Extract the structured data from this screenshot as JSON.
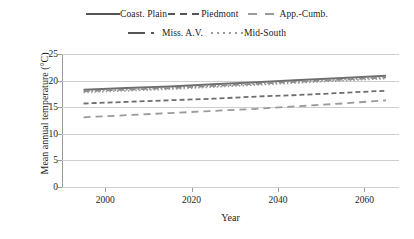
{
  "chart_data": {
    "type": "line",
    "title": "",
    "xlabel": "Year",
    "ylabel": "Mean annual temperature (°C)",
    "xlim": [
      1990,
      2068
    ],
    "ylim": [
      0,
      25
    ],
    "xticks": [
      2000,
      2020,
      2040,
      2060
    ],
    "yticks": [
      0,
      5,
      10,
      15,
      20,
      25
    ],
    "grid": true,
    "legend_position": "top-center",
    "x": [
      1995,
      2005,
      2015,
      2025,
      2035,
      2045,
      2055,
      2065
    ],
    "series": [
      {
        "name": "Coast. Plain",
        "style": "solid",
        "color": "#6e6e6e",
        "values": [
          18.3,
          18.6,
          18.9,
          19.3,
          19.7,
          20.1,
          20.5,
          20.9
        ]
      },
      {
        "name": "Piedmont",
        "style": "dashed",
        "color": "#6e6e6e",
        "values": [
          15.7,
          16.0,
          16.3,
          16.6,
          17.0,
          17.3,
          17.7,
          18.1
        ]
      },
      {
        "name": "App.-Cumb.",
        "style": "long-dash",
        "color": "#9a9a9a",
        "values": [
          13.1,
          13.5,
          13.9,
          14.3,
          14.7,
          15.2,
          15.7,
          16.3
        ]
      },
      {
        "name": "Miss. A.V.",
        "style": "dash-dot",
        "color": "#8a8a8a",
        "values": [
          18.0,
          18.3,
          18.6,
          19.0,
          19.4,
          19.8,
          20.2,
          20.6
        ]
      },
      {
        "name": "Mid-South",
        "style": "dotted",
        "color": "#9a9a9a",
        "values": [
          17.8,
          18.1,
          18.4,
          18.8,
          19.2,
          19.6,
          20.0,
          20.4
        ]
      }
    ]
  },
  "legend": {
    "rows": [
      [
        {
          "label": "Coast. Plain",
          "style": "solid"
        },
        {
          "label": "Piedmont",
          "style": "dashed"
        },
        {
          "label": "App.-Cumb.",
          "style": "long-dash"
        }
      ],
      [
        {
          "label": "Miss. A.V.",
          "style": "dash-dot"
        },
        {
          "label": "Mid-South",
          "style": "dotted"
        }
      ]
    ]
  },
  "axes": {
    "y_title": "Mean annual temperature (°C)",
    "x_title": "Year",
    "y_tick_labels": [
      "25",
      "20",
      "15",
      "10",
      "5",
      "0"
    ],
    "x_tick_labels": [
      "2000",
      "2020",
      "2040",
      "2060"
    ]
  }
}
